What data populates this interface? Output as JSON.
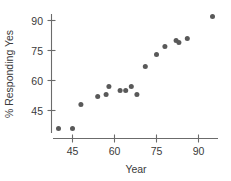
{
  "chart_data": {
    "type": "scatter",
    "title": "",
    "xlabel": "Year",
    "ylabel": "% Responding Yes",
    "xlim": [
      38,
      100
    ],
    "ylim": [
      33,
      96
    ],
    "xticks": [
      45,
      60,
      75,
      90
    ],
    "xticklabels": [
      "45",
      "60",
      "75",
      "90"
    ],
    "yticks": [
      45,
      60,
      75,
      90
    ],
    "yticklabels": [
      "45",
      "60",
      "75",
      "90"
    ],
    "grid": false,
    "legend": null,
    "point_color": "#595959",
    "axis_color": "#6b6b6b",
    "text_color": "#3a3a3a",
    "x": [
      40,
      45,
      48,
      54,
      57,
      58,
      62,
      64,
      66,
      68,
      71,
      75,
      78,
      82,
      83,
      86,
      95
    ],
    "y": [
      36,
      36,
      48,
      52,
      53,
      57,
      55,
      55,
      57,
      53,
      67,
      73,
      77,
      80,
      79,
      81,
      92
    ],
    "points": [
      {
        "x": 40,
        "y": 36
      },
      {
        "x": 45,
        "y": 36
      },
      {
        "x": 48,
        "y": 48
      },
      {
        "x": 54,
        "y": 52
      },
      {
        "x": 57,
        "y": 53
      },
      {
        "x": 58,
        "y": 57
      },
      {
        "x": 62,
        "y": 55
      },
      {
        "x": 64,
        "y": 55
      },
      {
        "x": 66,
        "y": 57
      },
      {
        "x": 68,
        "y": 53
      },
      {
        "x": 71,
        "y": 67
      },
      {
        "x": 75,
        "y": 73
      },
      {
        "x": 78,
        "y": 77
      },
      {
        "x": 82,
        "y": 80
      },
      {
        "x": 83,
        "y": 79
      },
      {
        "x": 86,
        "y": 81
      },
      {
        "x": 95,
        "y": 92
      }
    ]
  }
}
